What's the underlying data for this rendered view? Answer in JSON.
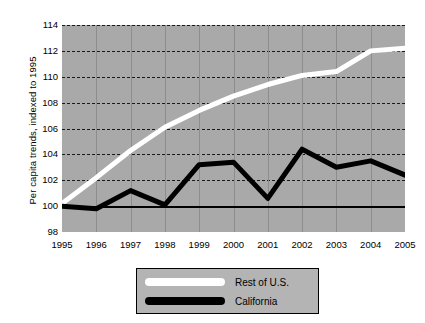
{
  "chart_data": {
    "type": "line",
    "title": "",
    "xlabel": "",
    "ylabel": "Per capita trends, indexed to 1995",
    "x": [
      1995,
      1996,
      1997,
      1998,
      1999,
      2000,
      2001,
      2002,
      2003,
      2004,
      2005
    ],
    "xtick_labels": [
      "1995",
      "1996",
      "1997",
      "1998",
      "1999",
      "2000",
      "2001",
      "2002",
      "2003",
      "2004",
      "2005"
    ],
    "ytick_labels": [
      "114",
      "112",
      "110",
      "108",
      "106",
      "104",
      "102",
      "100",
      "98"
    ],
    "yticks": [
      114,
      112,
      110,
      108,
      106,
      104,
      102,
      100,
      98
    ],
    "xlim": [
      1995,
      2005
    ],
    "ylim": [
      98,
      114
    ],
    "grid": "horizontal-dashed-and-vertical-solid",
    "reference_line": 100,
    "legend_position": "below-center",
    "series": [
      {
        "name": "Rest of U.S.",
        "color": "#ffffff",
        "values": [
          100.2,
          102.2,
          104.3,
          106.1,
          107.4,
          108.5,
          109.4,
          110.1,
          110.4,
          112.0,
          112.2
        ]
      },
      {
        "name": "California",
        "color": "#000000",
        "values": [
          100.0,
          99.8,
          101.2,
          100.1,
          103.2,
          103.4,
          100.6,
          104.4,
          103.0,
          103.5,
          102.4
        ]
      }
    ]
  },
  "legend": {
    "items": [
      {
        "label": "Rest of U.S.",
        "swatch": "white-line-swatch"
      },
      {
        "label": "California",
        "swatch": "black-line-swatch"
      }
    ]
  },
  "colors": {
    "plot_background": "#a9a9a9",
    "legend_background": "#b4b4b4",
    "gridline": "#1a1a1a",
    "vertical_gridline": "#8d8d8d",
    "page_background": "#ffffff"
  }
}
